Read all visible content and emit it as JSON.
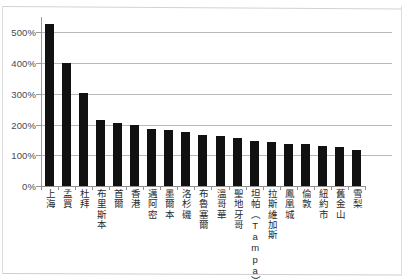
{
  "chart_data": {
    "type": "bar",
    "title": "",
    "subtitle": "",
    "xlabel": "",
    "ylabel": "",
    "ylim": [
      0,
      550
    ],
    "grid": true,
    "legend": false,
    "legend_position": "none",
    "y_tick_labels": [
      "0%",
      "100%",
      "200%",
      "300%",
      "400%",
      "500%"
    ],
    "y_ticks": [
      0,
      100,
      200,
      300,
      400,
      500
    ],
    "categories": [
      "上海",
      "孟買",
      "杜拜",
      "布里斯本",
      "首爾",
      "香港",
      "邁阿密",
      "墨爾本",
      "洛杉磯",
      "布魯塞爾",
      "溫哥華",
      "聖地牙哥",
      "坦帕（Tampa）",
      "拉斯維加斯",
      "鳳凰城",
      "倫敦",
      "紐約市",
      "舊金山",
      "雪梨"
    ],
    "values": [
      528,
      400,
      303,
      216,
      206,
      198,
      185,
      182,
      175,
      166,
      162,
      157,
      148,
      144,
      137,
      136,
      129,
      128,
      118
    ],
    "value_unit": "%",
    "bar_color": "#111111",
    "gridline_color": "#b9b9b9",
    "axis_color": "#8f8f8f",
    "background_color": "#ffffff"
  }
}
